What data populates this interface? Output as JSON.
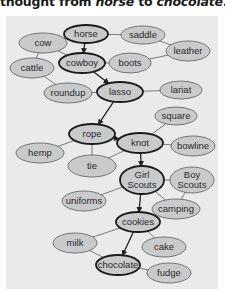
{
  "caption": {
    "prefix": "thought from ",
    "start": "horse",
    "middle": " to ",
    "end": "chocolate",
    "suffix": "."
  },
  "colors": {
    "panel_bg": "#e9eaea",
    "node_fill": "#c9cacb",
    "node_stroke": "#5a5a5a",
    "chain_stroke": "#1c1c1c",
    "edge": "#6e6e6e",
    "arrow": "#222222"
  },
  "diagram": {
    "nodes": [
      {
        "id": "horse",
        "label": "horse",
        "x": 86,
        "y": 34,
        "rx": 22,
        "ry": 9,
        "chain": true
      },
      {
        "id": "saddle",
        "label": "saddle",
        "x": 143,
        "y": 35,
        "rx": 22,
        "ry": 9,
        "chain": false
      },
      {
        "id": "cow",
        "label": "cow",
        "x": 43,
        "y": 43,
        "rx": 24,
        "ry": 10,
        "chain": false
      },
      {
        "id": "leather",
        "label": "leather",
        "x": 188,
        "y": 51,
        "rx": 22,
        "ry": 10,
        "chain": false
      },
      {
        "id": "cattle",
        "label": "cattle",
        "x": 32,
        "y": 68,
        "rx": 22,
        "ry": 10,
        "chain": false
      },
      {
        "id": "cowboy",
        "label": "cowboy",
        "x": 82,
        "y": 63,
        "rx": 23,
        "ry": 10,
        "chain": true
      },
      {
        "id": "boots",
        "label": "boots",
        "x": 130,
        "y": 63,
        "rx": 21,
        "ry": 10,
        "chain": false
      },
      {
        "id": "roundup",
        "label": "roundup",
        "x": 68,
        "y": 93,
        "rx": 24,
        "ry": 10,
        "chain": false
      },
      {
        "id": "lasso",
        "label": "lasso",
        "x": 120,
        "y": 92,
        "rx": 23,
        "ry": 10,
        "chain": true
      },
      {
        "id": "lariat",
        "label": "lariat",
        "x": 181,
        "y": 90,
        "rx": 21,
        "ry": 9,
        "chain": false
      },
      {
        "id": "square",
        "label": "square",
        "x": 176,
        "y": 116,
        "rx": 21,
        "ry": 9,
        "chain": false
      },
      {
        "id": "rope",
        "label": "rope",
        "x": 92,
        "y": 134,
        "rx": 23,
        "ry": 10,
        "chain": true
      },
      {
        "id": "knot",
        "label": "knot",
        "x": 140,
        "y": 143,
        "rx": 23,
        "ry": 10,
        "chain": true
      },
      {
        "id": "bowline",
        "label": "bowline",
        "x": 193,
        "y": 146,
        "rx": 22,
        "ry": 10,
        "chain": false
      },
      {
        "id": "hemp",
        "label": "hemp",
        "x": 40,
        "y": 153,
        "rx": 24,
        "ry": 10,
        "chain": false
      },
      {
        "id": "tie",
        "label": "tie",
        "x": 92,
        "y": 166,
        "rx": 24,
        "ry": 11,
        "chain": false
      },
      {
        "id": "girl-scouts",
        "label": "Girl",
        "label2": "Scouts",
        "x": 142,
        "y": 180,
        "rx": 22,
        "ry": 14,
        "chain": true
      },
      {
        "id": "boy-scouts",
        "label": "Boy",
        "label2": "Scouts",
        "x": 192,
        "y": 180,
        "rx": 22,
        "ry": 13,
        "chain": false
      },
      {
        "id": "uniforms",
        "label": "uniforms",
        "x": 84,
        "y": 201,
        "rx": 22,
        "ry": 10,
        "chain": false
      },
      {
        "id": "camping",
        "label": "camping",
        "x": 176,
        "y": 209,
        "rx": 24,
        "ry": 10,
        "chain": false
      },
      {
        "id": "cookies",
        "label": "cookies",
        "x": 138,
        "y": 222,
        "rx": 22,
        "ry": 10,
        "chain": true
      },
      {
        "id": "milk",
        "label": "milk",
        "x": 75,
        "y": 243,
        "rx": 22,
        "ry": 10,
        "chain": false
      },
      {
        "id": "cake",
        "label": "cake",
        "x": 164,
        "y": 247,
        "rx": 22,
        "ry": 10,
        "chain": false
      },
      {
        "id": "chocolate",
        "label": "chocolate",
        "x": 118,
        "y": 265,
        "rx": 22,
        "ry": 10,
        "chain": true
      },
      {
        "id": "fudge",
        "label": "fudge",
        "x": 169,
        "y": 273,
        "rx": 22,
        "ry": 10,
        "chain": false
      }
    ],
    "edges": [
      [
        "horse",
        "saddle"
      ],
      [
        "horse",
        "cow"
      ],
      [
        "saddle",
        "leather"
      ],
      [
        "cow",
        "cattle"
      ],
      [
        "cow",
        "cowboy"
      ],
      [
        "cowboy",
        "boots"
      ],
      [
        "boots",
        "leather"
      ],
      [
        "cattle",
        "roundup"
      ],
      [
        "roundup",
        "lasso"
      ],
      [
        "lasso",
        "lariat"
      ],
      [
        "square",
        "knot"
      ],
      [
        "rope",
        "hemp"
      ],
      [
        "rope",
        "tie"
      ],
      [
        "knot",
        "bowline"
      ],
      [
        "knot",
        "tie"
      ],
      [
        "girl-scouts",
        "boy-scouts"
      ],
      [
        "girl-scouts",
        "uniforms"
      ],
      [
        "girl-scouts",
        "camping"
      ],
      [
        "boy-scouts",
        "camping"
      ],
      [
        "cookies",
        "milk"
      ],
      [
        "cookies",
        "cake"
      ],
      [
        "chocolate",
        "milk"
      ],
      [
        "chocolate",
        "fudge"
      ]
    ],
    "arrows": [
      [
        "horse",
        "cowboy"
      ],
      [
        "cowboy",
        "lasso"
      ],
      [
        "lasso",
        "rope"
      ],
      [
        "rope",
        "knot"
      ],
      [
        "knot",
        "girl-scouts"
      ],
      [
        "girl-scouts",
        "cookies"
      ],
      [
        "cookies",
        "chocolate"
      ]
    ]
  }
}
